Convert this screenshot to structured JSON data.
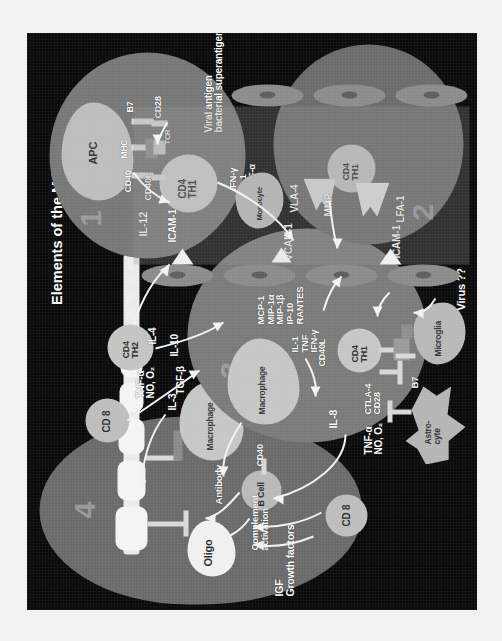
{
  "figure": {
    "title": "Elements of the MS lesion",
    "background_color": "#0a0a0a",
    "frame_color": "#f2f2f2",
    "text_color": "#ffffff",
    "rotation": "-90deg"
  },
  "panels": [
    {
      "number": "1",
      "name": "antigen-presentation"
    },
    {
      "number": "2",
      "name": "transendothelial-migration"
    },
    {
      "number": "3",
      "name": "cytokine-amplification"
    },
    {
      "number": "4",
      "name": "demyelination"
    }
  ],
  "panel1": {
    "cells": [
      {
        "label": "APC"
      },
      {
        "label": "CD4\nTH1"
      }
    ],
    "molecules": [
      {
        "label": "CD40"
      },
      {
        "label": "MHC"
      },
      {
        "label": "B7"
      },
      {
        "label": "CD40L"
      },
      {
        "label": "TCR"
      },
      {
        "label": "CD28"
      }
    ],
    "cytokines": [
      {
        "label": "IL-12"
      }
    ],
    "annotation": "Viral antigen\nbacterial superantigen"
  },
  "panel2": {
    "cells": [
      {
        "label": "CD4\nTH1"
      }
    ],
    "molecules": [
      {
        "label": "LFA-1"
      },
      {
        "label": "ICAM-1"
      },
      {
        "label": "VLA-4"
      },
      {
        "label": "VCAM-1"
      },
      {
        "label": "MMP"
      }
    ],
    "annotation": "Virus ??"
  },
  "panel3": {
    "cells": [
      {
        "label": "Macrophage"
      },
      {
        "label": "CD4\nTH1"
      },
      {
        "label": "Microglia"
      },
      {
        "label": "Astro-\ncyte"
      }
    ],
    "molecules": [
      {
        "label": "CD40L"
      },
      {
        "label": "CTLA-4\nCD28"
      },
      {
        "label": "B7"
      }
    ],
    "chemokines": "MCP-1\nMIP-1α\nMIP-1β\nIP-10\nRANTES",
    "cytokines_left": "IL-1\nTNF\nIFN-γ",
    "secreted": [
      {
        "label": "IL-8"
      },
      {
        "label": "TNF-α\nNO, O₂"
      }
    ]
  },
  "panel4": {
    "cells": [
      {
        "label": "Macrophage"
      },
      {
        "label": "B Cell"
      },
      {
        "label": "Oligo"
      }
    ],
    "molecules": [
      {
        "label": "CD40"
      }
    ],
    "processes": [
      {
        "label": "Antibody"
      },
      {
        "label": "Complement\nactivation"
      }
    ],
    "secreted": [
      {
        "label": "IL-3"
      },
      {
        "label": "TNF-α\nNO, O₂"
      }
    ]
  },
  "free_cells": [
    {
      "label": "CD 8",
      "name": "cd8-upper"
    },
    {
      "label": "CD 8",
      "name": "cd8-lower"
    },
    {
      "label": "CD4\nTH2",
      "name": "cd4-th2"
    },
    {
      "label": "Monocyte",
      "name": "monocyte"
    }
  ],
  "free_labels": {
    "igf": "IGF\nGrowth factors",
    "tgf_beta": "TGF-β",
    "il10": "IL-10",
    "il4": "IL-4",
    "icam1_upper": "ICAM-1",
    "icam1_lower": "ICAM-1",
    "vcam1": "VCAM-1",
    "endo_cytokines": "IFN-γ\nIL-1\nTNF-α"
  }
}
